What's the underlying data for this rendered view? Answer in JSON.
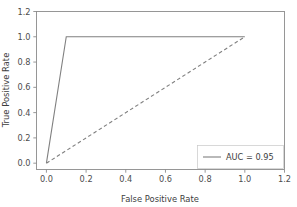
{
  "chart_data": {
    "type": "line",
    "title": "",
    "xlabel": "False Positive Rate",
    "ylabel": "True Positive Rate",
    "xlim": [
      -0.05,
      1.2
    ],
    "ylim": [
      -0.05,
      1.2
    ],
    "xticks": [
      "0.0",
      "0.2",
      "0.4",
      "0.6",
      "0.8",
      "1.0",
      "1.2"
    ],
    "xtick_values": [
      0.0,
      0.2,
      0.4,
      0.6,
      0.8,
      1.0,
      1.2
    ],
    "yticks": [
      "0.0",
      "0.2",
      "0.4",
      "0.6",
      "0.8",
      "1.0",
      "1.2"
    ],
    "ytick_values": [
      0.0,
      0.2,
      0.4,
      0.6,
      0.8,
      1.0,
      1.2
    ],
    "grid": false,
    "legend_position": "lower right",
    "series": [
      {
        "name": "AUC = 0.95",
        "style": "solid",
        "color": "#808080",
        "x": [
          0.0,
          0.1,
          1.0
        ],
        "y": [
          0.0,
          1.0,
          1.0
        ]
      },
      {
        "name": "chance-diagonal",
        "style": "dashed",
        "color": "#808080",
        "x": [
          0.0,
          1.0
        ],
        "y": [
          0.0,
          1.0
        ]
      }
    ]
  },
  "legend": {
    "entries": [
      {
        "label": "AUC = 0.95"
      }
    ]
  },
  "axes": {
    "x_title": "False Positive Rate",
    "y_title": "True Positive Rate"
  }
}
